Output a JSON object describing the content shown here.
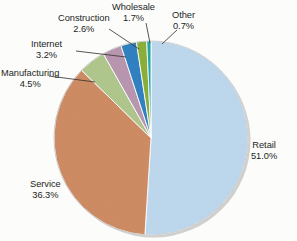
{
  "chart_data": {
    "type": "pie",
    "title": "",
    "xlabel": "",
    "ylabel": "",
    "unit": "%",
    "start_angle_deg": 0,
    "direction": "clockwise",
    "legend": "none",
    "labels_placement": "outside-with-leader-lines",
    "categories": [
      "Retail",
      "Service",
      "Manufacturing",
      "Internet",
      "Construction",
      "Wholesale",
      "Other"
    ],
    "values": [
      51.0,
      36.3,
      4.5,
      3.2,
      2.6,
      1.7,
      0.7
    ],
    "value_labels": [
      "51.0%",
      "36.3%",
      "4.5%",
      "3.2%",
      "2.6%",
      "1.7%",
      "0.7%"
    ],
    "colors": [
      "#bcd6ec",
      "#cd8a62",
      "#aec58b",
      "#b795ae",
      "#2f7fc0",
      "#8aad38",
      "#21a5a5"
    ],
    "slices": [
      {
        "name": "Retail",
        "value": 51.0,
        "label": "Retail",
        "percent_label": "51.0%",
        "color": "#bcd6ec"
      },
      {
        "name": "Service",
        "value": 36.3,
        "label": "Service",
        "percent_label": "36.3%",
        "color": "#cd8a62"
      },
      {
        "name": "Manufacturing",
        "value": 4.5,
        "label": "Manufacturing",
        "percent_label": "4.5%",
        "color": "#aec58b"
      },
      {
        "name": "Internet",
        "value": 3.2,
        "label": "Internet",
        "percent_label": "3.2%",
        "color": "#b795ae"
      },
      {
        "name": "Construction",
        "value": 2.6,
        "label": "Construction",
        "percent_label": "2.6%",
        "color": "#2f7fc0"
      },
      {
        "name": "Wholesale",
        "value": 1.7,
        "label": "Wholesale",
        "percent_label": "1.7%",
        "color": "#8aad38"
      },
      {
        "name": "Other",
        "value": 0.7,
        "label": "Other",
        "percent_label": "0.7%",
        "color": "#21a5a5"
      }
    ]
  },
  "labels": {
    "retail": {
      "name": "Retail",
      "percent": "51.0%"
    },
    "service": {
      "name": "Service",
      "percent": "36.3%"
    },
    "manufacturing": {
      "name": "Manufacturing",
      "percent": "4.5%"
    },
    "internet": {
      "name": "Internet",
      "percent": "3.2%"
    },
    "construction": {
      "name": "Construction",
      "percent": "2.6%"
    },
    "wholesale": {
      "name": "Wholesale",
      "percent": "1.7%"
    },
    "other": {
      "name": "Other",
      "percent": "0.7%"
    }
  }
}
